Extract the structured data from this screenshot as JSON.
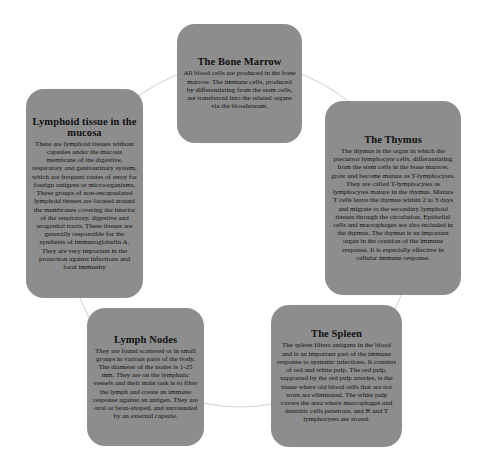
{
  "diagram": {
    "type": "cycle",
    "colors": {
      "box_fill": "#8d8d8d",
      "text": "#111111",
      "connector": "#cfcfcf",
      "background": "#ffffff"
    },
    "nodes": [
      {
        "id": "bone-marrow",
        "title": "The Bone Marrow",
        "text": "All blood cells are produced in the bone marrow. The immune cells, produced by differentiating from the stem cells, are transferred into the related organs via the bloodstream."
      },
      {
        "id": "thymus",
        "title": "The Thymus",
        "text": "The thymus is the organ in which the precursor lymphocyte cells, differantiating from the stem cells in the bone marrow, grow and become mature as T-lymphocytes. They are called T-lymphocytes as lymphocytes mature in the thymus. Mature T cells leave the thymus within 2 to 3 days and migrate to the secondary lymphoid tissues through the circulation. Epithelial cells and macrophages are also included in the thymus. The thymus is an important organ in the creation of the immune response. It is especially effective in cellular immune response."
      },
      {
        "id": "spleen",
        "title": "The Spleen",
        "text": "The spleen filters antigens in the blood and is an important part of the immune response to systemic infections. It consists of red and white pulp. The red pulp, supported by the red pulp arteries, is the tissue where old blood cells that are not worn are eliminated. The white pulp covers the area where macrophages and dentritic cells penetrate, and B and T lymphocytes are stored."
      },
      {
        "id": "lymph-nodes",
        "title": "Lymph Nodes",
        "text": "They are found scattered or in small groups in various parts of the body. The diameter of the nodes is 1-25 mm. They are on the lymphatic vessels and their main task is to filter the lymph and create an immune response against an antigen. They are oval or bean-shaped, and surrounded by an external capsule."
      },
      {
        "id": "lymphoid-mucosa",
        "title": "Lymphoid tissue in the mucosa",
        "text": "There are lymphoid tissues without capsules under the mucous membrane of the digestive, respiratory and genitourinary system, which are frequent routes of entry for foreign antigens or microorganisms. These groups of non-encapsulated lymphoid tissues are located around the membranes covering the interior of the respiratory, digestive and urogenital tracts. These tissues are generally responsible for the synthesis of immunoglobulin A. They are very important in the protection against infections and local immunity"
      }
    ]
  }
}
